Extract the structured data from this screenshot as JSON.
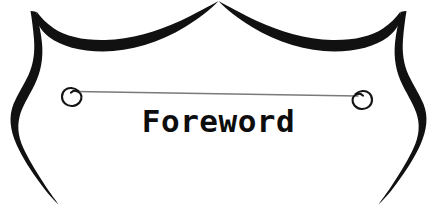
{
  "page": {
    "background_color": "#ffffff",
    "width": 437,
    "height": 224
  },
  "banner": {
    "title": "Foreword",
    "title_color": "#0d0d0d",
    "ornament_color": "#111111",
    "rule_color": "#7a7a7a",
    "elements": {
      "top_left_flourish": "top-left-scroll-arc",
      "top_right_flourish": "top-right-scroll-arc",
      "left_brace": "left-brace-stroke",
      "right_brace": "right-brace-stroke",
      "divider_rule": "horizontal-divider-rule",
      "left_curl": "left-spiral-curl",
      "right_curl": "right-spiral-curl"
    }
  }
}
